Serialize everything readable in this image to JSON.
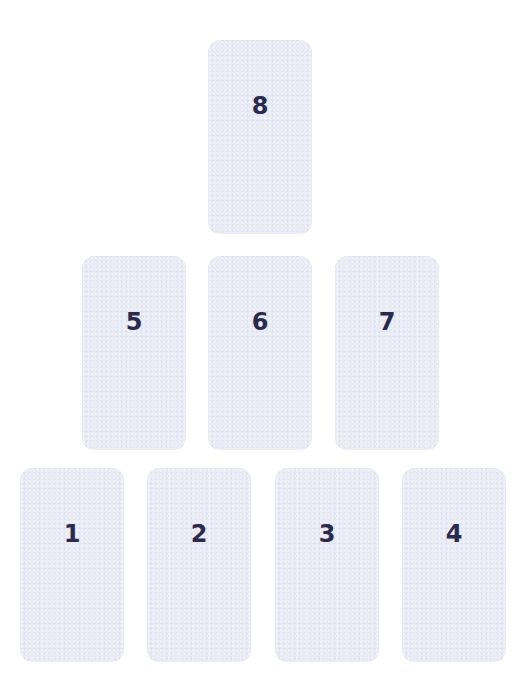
{
  "diagram": {
    "type": "card-spread",
    "card_color": "#e9ebf5",
    "number_color": "#2b2a4c",
    "rows": [
      {
        "row": "top",
        "cards": [
          {
            "position": 8,
            "label": "8"
          }
        ]
      },
      {
        "row": "middle",
        "cards": [
          {
            "position": 5,
            "label": "5"
          },
          {
            "position": 6,
            "label": "6"
          },
          {
            "position": 7,
            "label": "7"
          }
        ]
      },
      {
        "row": "bottom",
        "cards": [
          {
            "position": 1,
            "label": "1"
          },
          {
            "position": 2,
            "label": "2"
          },
          {
            "position": 3,
            "label": "3"
          },
          {
            "position": 4,
            "label": "4"
          }
        ]
      }
    ]
  },
  "cards": {
    "c1": {
      "label": "1"
    },
    "c2": {
      "label": "2"
    },
    "c3": {
      "label": "3"
    },
    "c4": {
      "label": "4"
    },
    "c5": {
      "label": "5"
    },
    "c6": {
      "label": "6"
    },
    "c7": {
      "label": "7"
    },
    "c8": {
      "label": "8"
    }
  }
}
